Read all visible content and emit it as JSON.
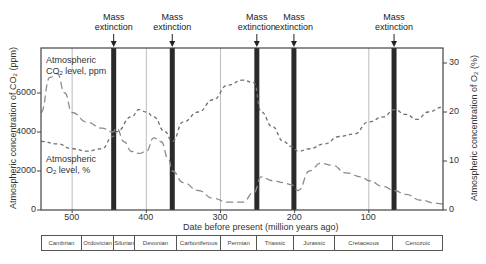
{
  "chart_data": {
    "type": "line",
    "title": "",
    "xlabel": "Date before present (million years ago)",
    "ylabel_left": "Atmospheric concentration of CO2 (ppm)",
    "ylabel_right": "Atmospheric concentration of O2 (%)",
    "x_reversed": true,
    "xlim": [
      542,
      0
    ],
    "ylim_left": [
      0,
      8400
    ],
    "ylim_right": [
      0,
      33
    ],
    "x_ticks": [
      500,
      400,
      300,
      200,
      100
    ],
    "y_ticks_left": [
      0,
      2000,
      4000,
      6000
    ],
    "y_ticks_right": [
      0,
      10,
      20,
      30
    ],
    "gridlines_x": [
      500,
      400,
      300,
      100
    ],
    "legend": "inline annotations",
    "annotations": [
      {
        "text": "Atmospheric CO2 level, ppm",
        "series": "CO2"
      },
      {
        "text": "Atmospheric O2 level, %",
        "series": "O2"
      }
    ],
    "mass_extinctions": [
      {
        "label": "Mass extinction",
        "x": 444
      },
      {
        "label": "Mass extinction",
        "x": 365
      },
      {
        "label": "Mass extinction",
        "x": 251
      },
      {
        "label": "Mass extinction",
        "x": 201
      },
      {
        "label": "Mass extinction",
        "x": 66
      }
    ],
    "series": [
      {
        "name": "Atmospheric CO2 level, ppm",
        "axis": "left",
        "style": "long-dash",
        "x": [
          542,
          530,
          520,
          510,
          500,
          480,
          460,
          445,
          440,
          430,
          420,
          410,
          400,
          390,
          380,
          370,
          365,
          350,
          330,
          310,
          290,
          270,
          255,
          245,
          230,
          215,
          205,
          195,
          180,
          165,
          150,
          130,
          110,
          100,
          80,
          66,
          50,
          30,
          10,
          0
        ],
        "values": [
          5000,
          6800,
          7000,
          6000,
          5000,
          4500,
          4200,
          4000,
          4200,
          3500,
          3000,
          2900,
          3000,
          3700,
          3500,
          2600,
          2000,
          1400,
          1000,
          600,
          400,
          400,
          900,
          1700,
          1500,
          1400,
          1300,
          1000,
          2000,
          2400,
          2300,
          1900,
          1700,
          1500,
          1200,
          1000,
          800,
          500,
          350,
          300
        ]
      },
      {
        "name": "Atmospheric O2 level, %",
        "axis": "right",
        "style": "short-dash",
        "x": [
          542,
          520,
          500,
          480,
          460,
          445,
          440,
          420,
          410,
          400,
          390,
          375,
          365,
          350,
          330,
          310,
          290,
          270,
          255,
          245,
          230,
          215,
          205,
          195,
          180,
          160,
          140,
          120,
          100,
          80,
          66,
          50,
          35,
          20,
          0
        ],
        "values": [
          14,
          13.5,
          12.5,
          12,
          12.5,
          15,
          16,
          19,
          20.5,
          20,
          19,
          16,
          14,
          18,
          20,
          22.5,
          25.5,
          26.5,
          26,
          20,
          17,
          14,
          13,
          12,
          12.5,
          13.5,
          15,
          15.5,
          18,
          19,
          20.5,
          19.5,
          18.5,
          20,
          21
        ]
      }
    ],
    "periods": [
      {
        "name": "Cambrian",
        "start": 542,
        "end": 488
      },
      {
        "name": "Ordovician",
        "start": 488,
        "end": 444
      },
      {
        "name": "Silurian",
        "start": 444,
        "end": 416
      },
      {
        "name": "Devonian",
        "start": 416,
        "end": 359
      },
      {
        "name": "Carboniferous",
        "start": 359,
        "end": 299
      },
      {
        "name": "Permian",
        "start": 299,
        "end": 251
      },
      {
        "name": "Triassic",
        "start": 251,
        "end": 200
      },
      {
        "name": "Jurassic",
        "start": 200,
        "end": 145
      },
      {
        "name": "Cretaceous",
        "start": 145,
        "end": 66
      },
      {
        "name": "Cenozoic",
        "start": 66,
        "end": 0
      }
    ]
  },
  "labels": {
    "co2_annot_line1": "Atmospheric",
    "co2_annot_line2_pre": "CO",
    "co2_annot_sub": "2",
    "co2_annot_line2_post": " level, ppm",
    "o2_annot_line1": "Atmospheric",
    "o2_annot_line2_pre": "O",
    "o2_annot_sub": "2",
    "o2_annot_line2_post": " level, %",
    "ylabel_left_pre": "Atmospheric concentration of CO",
    "ylabel_left_sub": "2",
    "ylabel_left_post": " (ppm)",
    "ylabel_right_pre": "Atmospheric concentration of O",
    "ylabel_right_sub": "2",
    "ylabel_right_post": " (%)",
    "xlabel": "Date before present (million years ago)",
    "extinction_line1": "Mass",
    "extinction_line2": "extinction"
  },
  "colors": {
    "frame": "#444444",
    "extinction_bar": "#2a2a2a",
    "gridline": "#bdbdbd",
    "co2_line": "#8a8a8a",
    "o2_line": "#6f6f6f",
    "text": "#333333"
  }
}
